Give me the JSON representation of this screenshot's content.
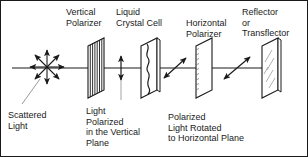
{
  "diagram": {
    "title_alt": "Reflective LCD optical path",
    "stroke_color": "#1a1a1a",
    "fill_color": "#ffffff",
    "background": "#ffffff",
    "width": 308,
    "height": 157
  },
  "top_labels": [
    {
      "id": "vertical-polarizer",
      "lines": [
        "Vertical",
        "Polarizer"
      ],
      "x": 66,
      "y": 7
    },
    {
      "id": "liquid-crystal-cell",
      "lines": [
        "Liquid",
        "Crystal Cell"
      ],
      "x": 116,
      "y": 7
    },
    {
      "id": "horizontal-polarizer",
      "lines": [
        "Horizontal",
        "Polarizer"
      ],
      "x": 186,
      "y": 7
    },
    {
      "id": "reflector-or-transflector",
      "lines": [
        "Reflector",
        "or",
        "Transflector"
      ],
      "x": 242,
      "y": 2
    }
  ],
  "bottom_labels": [
    {
      "id": "scattered-light",
      "lines": [
        "Scattered",
        "Light"
      ],
      "x": 8,
      "y": 110
    },
    {
      "id": "light-polarized-vertical",
      "lines": [
        "Light",
        "Polarized",
        "in the Vertical",
        "Plane"
      ],
      "x": 86,
      "y": 106
    },
    {
      "id": "polarized-light-rotated",
      "lines": [
        "Polarized",
        "Light Rotated",
        "to Horizontal Plane"
      ],
      "x": 168,
      "y": 112
    }
  ],
  "elements": [
    {
      "id": "vertical-polarizer-panel",
      "type": "panel",
      "hatch": "vertical",
      "x": 88
    },
    {
      "id": "liquid-crystal-cell-panel",
      "type": "panel",
      "hatch": "wavy",
      "x": 142
    },
    {
      "id": "horizontal-polarizer-panel",
      "type": "panel",
      "hatch": "none",
      "x": 196
    },
    {
      "id": "reflector-panel",
      "type": "panel",
      "hatch": "diagonal-shine",
      "x": 262
    }
  ],
  "beam": {
    "axis_y": 68,
    "start_x": 6,
    "end_x": 302
  },
  "polarization_markers": [
    {
      "id": "vertical-polarization-arrow",
      "orientation": "vertical",
      "x": 121,
      "label_ref": "light-polarized-vertical"
    },
    {
      "id": "rotating-polarization-arrow-1",
      "orientation": "diagonal",
      "x": 175
    },
    {
      "id": "rotating-polarization-arrow-2",
      "orientation": "diagonal",
      "x": 237
    }
  ],
  "scattered_light": {
    "id": "scattered-light-starburst",
    "center_x": 47,
    "center_y": 67,
    "ray_count": 8,
    "radius": 17
  }
}
